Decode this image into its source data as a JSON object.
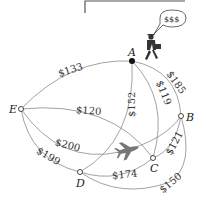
{
  "diagram": {
    "type": "weighted-complete-graph",
    "nodes": [
      {
        "id": "A",
        "label": "A",
        "start": true
      },
      {
        "id": "B",
        "label": "B"
      },
      {
        "id": "C",
        "label": "C"
      },
      {
        "id": "D",
        "label": "D"
      },
      {
        "id": "E",
        "label": "E"
      }
    ],
    "edges": [
      {
        "from": "A",
        "to": "E",
        "label": "$133"
      },
      {
        "from": "A",
        "to": "B",
        "label": "$185"
      },
      {
        "from": "A",
        "to": "C",
        "label": "$119"
      },
      {
        "from": "A",
        "to": "D",
        "label": "$152"
      },
      {
        "from": "E",
        "to": "C",
        "label": "$120"
      },
      {
        "from": "E",
        "to": "B",
        "label": "$200"
      },
      {
        "from": "E",
        "to": "D",
        "label": "$199"
      },
      {
        "from": "D",
        "to": "C",
        "label": "$174"
      },
      {
        "from": "C",
        "to": "B",
        "label": "$121"
      },
      {
        "from": "D",
        "to": "B",
        "label": "$150"
      }
    ],
    "speech_bubble": "$$$",
    "icons": [
      "businessman-icon",
      "airplane-icon"
    ]
  }
}
